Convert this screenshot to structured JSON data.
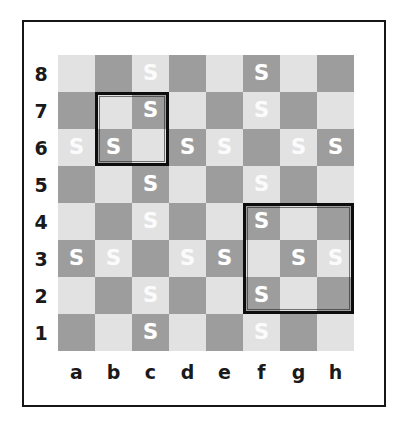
{
  "figure": {
    "kind": "chessboard-diagram",
    "files": [
      "a",
      "b",
      "c",
      "d",
      "e",
      "f",
      "g",
      "h"
    ],
    "ranks": [
      "8",
      "7",
      "6",
      "5",
      "4",
      "3",
      "2",
      "1"
    ],
    "mark_symbol": "S",
    "colors": {
      "light_square": "#e2e2e2",
      "dark_square": "#9d9d9d",
      "mark": "#ffffff",
      "frame": "#161616",
      "highlight": "#0d0d0d",
      "background": "#ffffff"
    }
  },
  "chart_data": {
    "type": "heatmap",
    "title": "",
    "xlabel": "",
    "ylabel": "",
    "categories": [
      "a",
      "b",
      "c",
      "d",
      "e",
      "f",
      "g",
      "h"
    ],
    "rows": [
      "8",
      "7",
      "6",
      "5",
      "4",
      "3",
      "2",
      "1"
    ],
    "cell_symbol": "S",
    "legend": [],
    "grid": true,
    "marked_squares": [
      "c8",
      "f8",
      "c7",
      "f7",
      "a6",
      "b6",
      "d6",
      "e6",
      "g6",
      "h6",
      "c5",
      "f5",
      "c4",
      "f4",
      "a3",
      "b3",
      "d3",
      "e3",
      "g3",
      "h3",
      "c2",
      "f2",
      "c1",
      "f1"
    ],
    "board": [
      {
        "rank": "8",
        "cells": [
          "",
          "",
          "S",
          "",
          "",
          "S",
          "",
          ""
        ]
      },
      {
        "rank": "7",
        "cells": [
          "",
          "",
          "S",
          "",
          "",
          "S",
          "",
          ""
        ]
      },
      {
        "rank": "6",
        "cells": [
          "S",
          "S",
          "",
          "S",
          "S",
          "",
          "S",
          "S"
        ]
      },
      {
        "rank": "5",
        "cells": [
          "",
          "",
          "S",
          "",
          "",
          "S",
          "",
          ""
        ]
      },
      {
        "rank": "4",
        "cells": [
          "",
          "",
          "S",
          "",
          "",
          "S",
          "",
          ""
        ]
      },
      {
        "rank": "3",
        "cells": [
          "S",
          "S",
          "",
          "S",
          "S",
          "",
          "S",
          "S"
        ]
      },
      {
        "rank": "2",
        "cells": [
          "",
          "",
          "S",
          "",
          "",
          "S",
          "",
          ""
        ]
      },
      {
        "rank": "1",
        "cells": [
          "",
          "",
          "S",
          "",
          "",
          "S",
          "",
          ""
        ]
      }
    ],
    "highlight_boxes": [
      {
        "name": "box-b7-c6",
        "label": "b7-c6",
        "file_start": 1,
        "rank_start": 1,
        "cols": 2,
        "rows": 2
      },
      {
        "name": "box-f4-h2",
        "label": "f4-h2",
        "file_start": 5,
        "rank_start": 4,
        "cols": 3,
        "rows": 3
      }
    ]
  }
}
